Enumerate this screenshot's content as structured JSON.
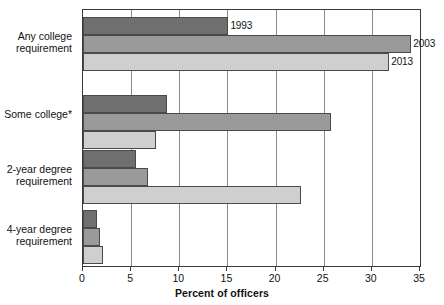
{
  "chart_data": {
    "type": "bar",
    "orientation": "horizontal",
    "title": "",
    "xlabel": "Percent of officers",
    "ylabel": "",
    "xlim": [
      0,
      35
    ],
    "xticks": [
      0,
      5,
      10,
      15,
      20,
      25,
      30,
      35
    ],
    "grid": "vertical",
    "legend_position": "inline-data-labels",
    "categories": [
      "Any college requirement",
      "Some college*",
      "2-year degree requirement",
      "4-year degree requirement"
    ],
    "category_lines": [
      [
        "Any college",
        "requirement"
      ],
      [
        "Some college*"
      ],
      [
        "2-year degree",
        "requirement"
      ],
      [
        "4-year degree",
        "requirement"
      ]
    ],
    "series": [
      {
        "name": "1993",
        "color": "#6f6f6f",
        "values": [
          15.1,
          8.7,
          5.5,
          1.5
        ]
      },
      {
        "name": "2003",
        "color": "#9a9a9a",
        "values": [
          34.1,
          25.8,
          6.7,
          1.8
        ]
      },
      {
        "name": "2013",
        "color": "#cfcfcf",
        "values": [
          31.8,
          7.6,
          22.6,
          2.1
        ]
      }
    ],
    "annotations": [
      {
        "text": "1993",
        "series": "1993",
        "category": "Any college requirement"
      },
      {
        "text": "2003",
        "series": "2003",
        "category": "Any college requirement"
      },
      {
        "text": "2013",
        "series": "2013",
        "category": "Any college requirement"
      }
    ],
    "footnote": "*"
  },
  "axis": {
    "tick_labels": [
      "0",
      "5",
      "10",
      "15",
      "20",
      "25",
      "30",
      "35"
    ],
    "x_title": "Percent of officers"
  },
  "labels": {
    "cat0_line0": "Any college",
    "cat0_line1": "requirement",
    "cat1_line0": "Some college*",
    "cat2_line0": "2-year degree",
    "cat2_line1": "requirement",
    "cat3_line0": "4-year degree",
    "cat3_line1": "requirement",
    "ann_1993": "1993",
    "ann_2003": "2003",
    "ann_2013": "2013"
  },
  "colors": {
    "series_1993": "#6f6f6f",
    "series_2003": "#9a9a9a",
    "series_2013": "#cfcfcf",
    "axis": "#3a3a3a",
    "grid": "#8a8a8a",
    "background": "#ffffff"
  }
}
